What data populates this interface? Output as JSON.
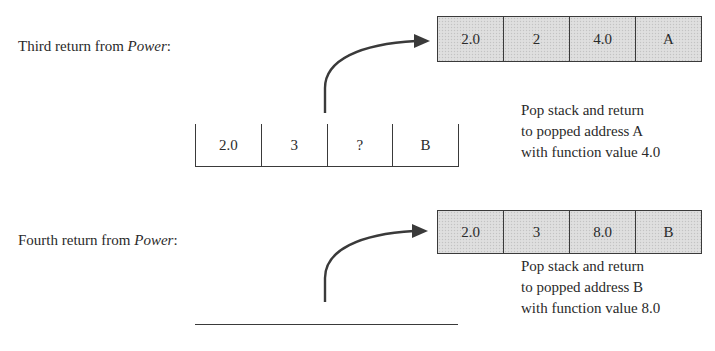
{
  "sections": [
    {
      "label_prefix": "Third return from ",
      "label_function": "Power",
      "label_suffix": ":",
      "popped_frame": {
        "shaded": true,
        "cells": [
          "2.0",
          "2",
          "4.0",
          "A"
        ]
      },
      "remaining_stack": {
        "cells": [
          "2.0",
          "3",
          "?",
          "B"
        ]
      },
      "note_lines": [
        "Pop stack and return",
        "to popped address A",
        "with function value 4.0"
      ]
    },
    {
      "label_prefix": "Fourth return from ",
      "label_function": "Power",
      "label_suffix": ":",
      "popped_frame": {
        "shaded": true,
        "cells": [
          "2.0",
          "3",
          "8.0",
          "B"
        ]
      },
      "remaining_stack": {
        "cells": [],
        "empty": true
      },
      "note_lines": [
        "Pop stack and return",
        "to popped address B",
        "with function value 8.0"
      ]
    }
  ],
  "colors": {
    "line": "#3a3a3a",
    "frame_fill": "#dcdcdc",
    "text": "#2a2a2a"
  }
}
